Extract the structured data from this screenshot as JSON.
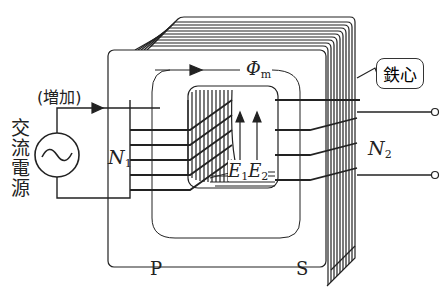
{
  "diagram": {
    "type": "transformer",
    "source_label": "交流電源",
    "increase_label": "(増加)",
    "flux_label": "Φ",
    "flux_sub": "m",
    "primary_turns": "N",
    "primary_turns_sub": "1",
    "secondary_turns": "N",
    "secondary_turns_sub": "2",
    "emf1": "E",
    "emf1_sub": "1",
    "emf2": "E",
    "emf2_sub": "2",
    "core_label": "鉄心",
    "primary_side": "P",
    "secondary_side": "S",
    "line_color": "#222222",
    "background": "#ffffff"
  }
}
